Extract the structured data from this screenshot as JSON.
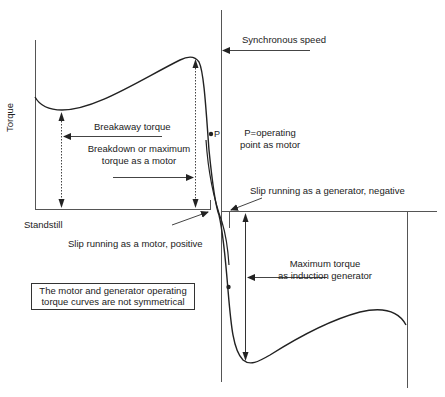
{
  "diagram": {
    "axis": {
      "y_label": "Torque",
      "x_origin_label": "Standstill"
    },
    "labels": {
      "synchronous_speed": "Synchronous speed",
      "breakaway_torque": "Breakaway torque",
      "breakdown_torque_line1": "Breakdown or maximum",
      "breakdown_torque_line2": "torque as a motor",
      "operating_point_line1": "P=operating",
      "operating_point_line2": "point as motor",
      "operating_point_marker": "P",
      "slip_generator": "Slip running as a generator, negative",
      "slip_motor": "Slip running as a motor, positive",
      "max_gen_torque_line1": "Maximum torque",
      "max_gen_torque_line2": "as induction generator",
      "note_line1": "The motor and generator operating",
      "note_line2": "torque curves are not symmetrical"
    },
    "colors": {
      "line": "#2a2a2a",
      "axis": "#555555",
      "background": "#ffffff"
    }
  }
}
